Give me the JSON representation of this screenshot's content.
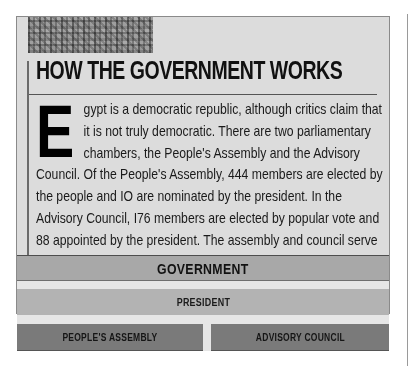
{
  "document": {
    "title": "HOW THE GOVERNMENT WORKS",
    "dropcap": "E",
    "body": "gypt is a democratic republic, although critics claim that it is not truly democratic. There are two parliamentary chambers, the People's Assembly and the Advisory Council. Of the People's Assembly, 444 members are elected by the people and IO are nominated by the president. In the Advisory Council, I76 members are elected by popular vote and 88 appointed by the president. The assembly and council serve a five-year term. The president serves a six-year term.",
    "image": "hieroglyph-relief-image"
  },
  "diagram": {
    "top": "GOVERNMENT",
    "middle": "PRESIDENT",
    "bottom": [
      "PEOPLE'S ASSEMBLY",
      "ADVISORY COUNCIL"
    ]
  },
  "colors": {
    "panel": "#dcdcdc",
    "government_bar": "#a8a8a8",
    "president_bar": "#b3b3b3",
    "chamber_bar": "#7a7a7a",
    "text": "#111111"
  }
}
